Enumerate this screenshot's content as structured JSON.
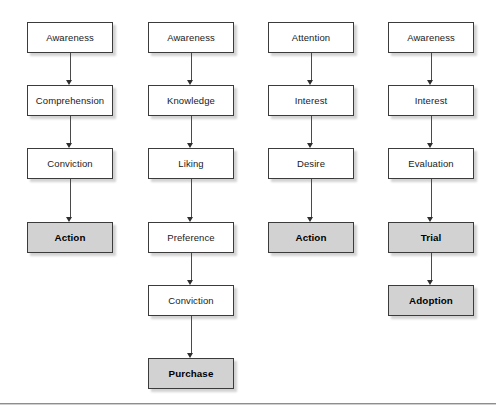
{
  "diagram": {
    "background_color": "#ffffff",
    "box_fill_default": "#ffffff",
    "box_fill_highlight": "#d2d2d2",
    "box_border_color": "#3b3b3b",
    "arrow_color": "#4a4a4a",
    "baseline": {
      "y": 403,
      "color": "#8e8e8e"
    },
    "layout": {
      "column_lefts": [
        10,
        131,
        251,
        371
      ],
      "box_width": 86,
      "box_height": 31,
      "row_tops": [
        22,
        85,
        148,
        222,
        285,
        358
      ]
    },
    "columns": [
      {
        "name": "column-1",
        "left": 10,
        "nodes": [
          {
            "label": "Awareness",
            "row": 0,
            "highlight": false
          },
          {
            "label": "Comprehension",
            "row": 1,
            "highlight": false
          },
          {
            "label": "Conviction",
            "row": 2,
            "highlight": false
          },
          {
            "label": "Action",
            "row": 3,
            "highlight": true
          }
        ]
      },
      {
        "name": "column-2",
        "left": 131,
        "nodes": [
          {
            "label": "Awareness",
            "row": 0,
            "highlight": false
          },
          {
            "label": "Knowledge",
            "row": 1,
            "highlight": false
          },
          {
            "label": "Liking",
            "row": 2,
            "highlight": false
          },
          {
            "label": "Preference",
            "row": 3,
            "highlight": false
          },
          {
            "label": "Conviction",
            "row": 4,
            "highlight": false
          },
          {
            "label": "Purchase",
            "row": 5,
            "highlight": true
          }
        ]
      },
      {
        "name": "column-3",
        "left": 251,
        "nodes": [
          {
            "label": "Attention",
            "row": 0,
            "highlight": false
          },
          {
            "label": "Interest",
            "row": 1,
            "highlight": false
          },
          {
            "label": "Desire",
            "row": 2,
            "highlight": false
          },
          {
            "label": "Action",
            "row": 3,
            "highlight": true
          }
        ]
      },
      {
        "name": "column-4",
        "left": 371,
        "nodes": [
          {
            "label": "Awareness",
            "row": 0,
            "highlight": false
          },
          {
            "label": "Interest",
            "row": 1,
            "highlight": false
          },
          {
            "label": "Evaluation",
            "row": 2,
            "highlight": false
          },
          {
            "label": "Trial",
            "row": 3,
            "highlight": true
          },
          {
            "label": "Adoption",
            "row": 4,
            "highlight": true
          }
        ]
      }
    ]
  }
}
